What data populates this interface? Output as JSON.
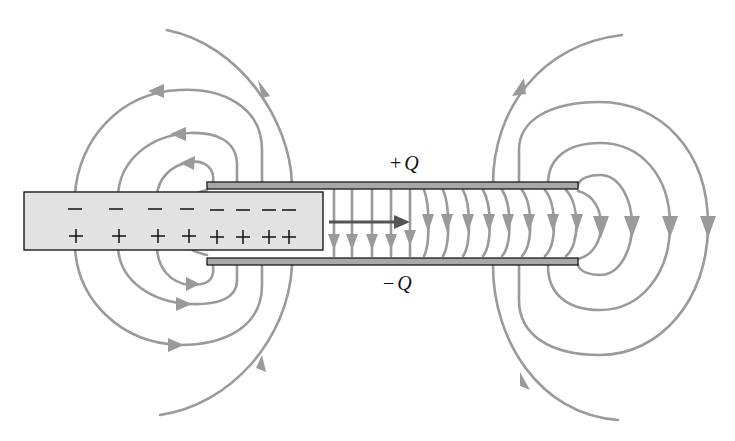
{
  "figure": {
    "labels": {
      "top_plate_charge": "+Q",
      "bottom_plate_charge": "−Q",
      "top_sign": "+",
      "bottom_sign": "−",
      "q_symbol": "Q"
    },
    "dielectric_slab": {
      "surface_charges_top": [
        "−",
        "−",
        "−",
        "−",
        "−",
        "−",
        "−",
        "−"
      ],
      "surface_charges_bottom": [
        "+",
        "+",
        "+",
        "+",
        "+",
        "+",
        "+",
        "+"
      ]
    },
    "colors": {
      "field_lines": "#9a9a9a",
      "plates": "#a8a8a8",
      "slab_fill": "#e2e2e2",
      "outline": "#1a1a1a",
      "motion_arrow": "#555555"
    },
    "motion_arrow": "force-direction-right"
  }
}
